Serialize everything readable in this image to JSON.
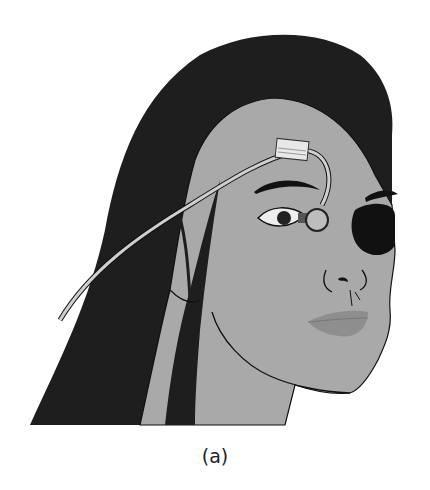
{
  "figure": {
    "caption": "(a)",
    "colors": {
      "hair": "#1e1e1e",
      "skin": "#a9a9a9",
      "eyepatch": "#111111",
      "lips": "#8e8e8e",
      "tape": "#e8e8e8",
      "cable": "#c8c8c8",
      "outline": "#111111"
    }
  }
}
